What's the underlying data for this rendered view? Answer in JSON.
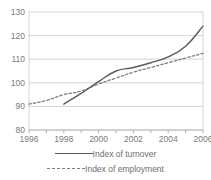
{
  "chart_data": {
    "type": "line",
    "title": "",
    "subtitle": "",
    "xlabel": "",
    "ylabel": "",
    "xlim": [
      1996,
      2006
    ],
    "ylim": [
      80,
      130
    ],
    "yticks": [
      80,
      90,
      100,
      110,
      120,
      130
    ],
    "xticks": [
      1996,
      1998,
      2000,
      2002,
      2004,
      2006
    ],
    "xtick_labels": [
      "1996",
      "1998",
      "2000",
      "2002",
      "2004",
      "2006"
    ],
    "ytick_labels": [
      "80",
      "90",
      "100",
      "110",
      "120",
      "130"
    ],
    "grid": "horizontal",
    "legend_position": "bottom",
    "x": [
      1996,
      1997,
      1998,
      1999,
      2000,
      2001,
      2002,
      2003,
      2004,
      2005,
      2006
    ],
    "series": [
      {
        "name": "Index of turnover",
        "style": "solid",
        "color": "#5a5a5a",
        "x": [
          1998,
          1999,
          2000,
          2001,
          2002,
          2003,
          2004,
          2005,
          2006
        ],
        "values": [
          91.0,
          95.5,
          100.5,
          105.0,
          106.5,
          108.5,
          111.0,
          115.5,
          124.0
        ]
      },
      {
        "name": "Index of employment",
        "style": "dashed",
        "color": "#7d7d7d",
        "x": [
          1996,
          1997,
          1998,
          1999,
          2000,
          2001,
          2002,
          2003,
          2004,
          2005,
          2006
        ],
        "values": [
          91.0,
          92.5,
          95.0,
          96.5,
          99.5,
          102.0,
          104.5,
          106.5,
          108.5,
          110.5,
          112.5
        ]
      }
    ]
  },
  "axis": {
    "y_labels": [
      "130",
      "120",
      "110",
      "100",
      "90",
      "80"
    ],
    "x_labels": [
      "1996",
      "1998",
      "2000",
      "2002",
      "2004",
      "2006"
    ]
  },
  "legend": {
    "items": [
      {
        "label": "Index of turnover",
        "style": "solid"
      },
      {
        "label": "Index of employment",
        "style": "dashed"
      }
    ]
  }
}
